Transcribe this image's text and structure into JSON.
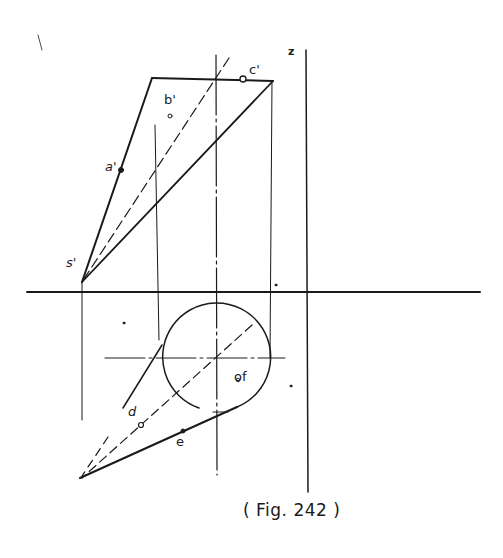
{
  "figure": {
    "caption": "( Fig. 242 )",
    "axis_label": "z"
  },
  "elevation": {
    "labels": {
      "apex": "s'",
      "a": "a'",
      "b": "b'",
      "c": "c'"
    }
  },
  "plan": {
    "labels": {
      "d": "d",
      "e": "e",
      "f": "of"
    }
  },
  "colors": {
    "ink": "#1a1a1a",
    "background": "#ffffff"
  }
}
